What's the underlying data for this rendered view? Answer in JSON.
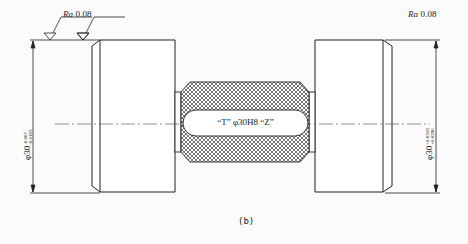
{
  "figure": {
    "caption": "(b)",
    "center_label": "“T” φ30H8 “Z”",
    "roughness_left": {
      "prefix": "Ra",
      "value": "0.08"
    },
    "roughness_right": {
      "prefix": "Ra",
      "value": "0.08"
    },
    "dim_left": {
      "base": "φ30",
      "upper": "-0.007",
      "lower": "-0.0103"
    },
    "dim_right": {
      "base": "φ30",
      "upper": "+0.0318",
      "lower": "+0.0286"
    },
    "colors": {
      "line": "#222222",
      "hatch": "#555555",
      "background": "#ffffff"
    }
  }
}
